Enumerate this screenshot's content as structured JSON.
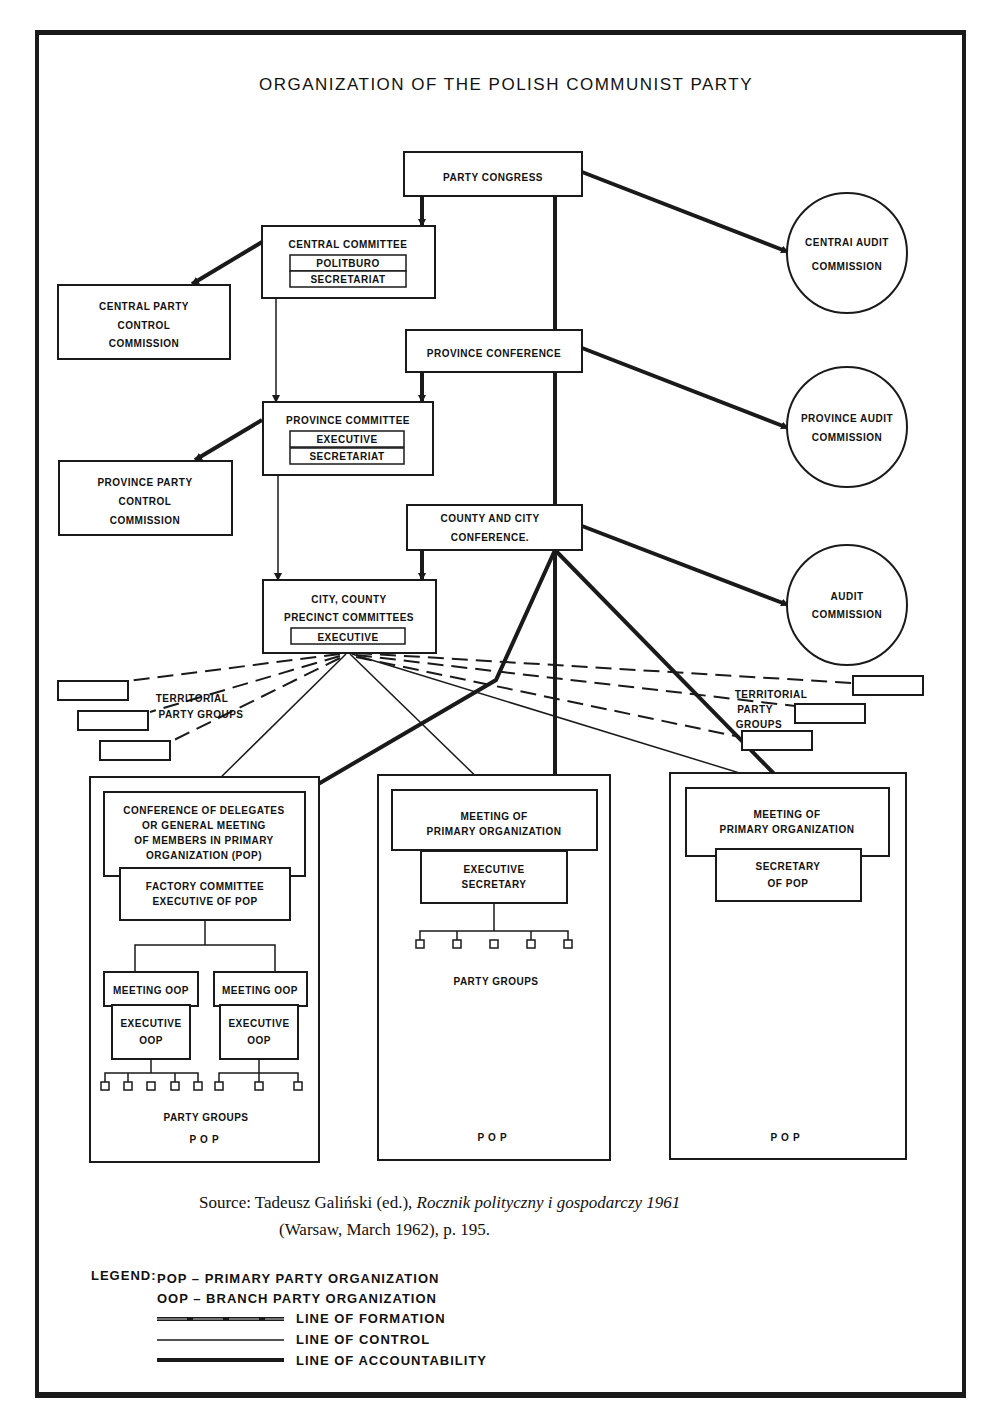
{
  "title": "ORGANIZATION OF THE POLISH COMMUNIST PARTY",
  "nodes": {
    "party_congress": "PARTY CONGRESS",
    "central_committee": {
      "title": "CENTRAL COMMITTEE",
      "sub": [
        "POLITBURO",
        "SECRETARIAT"
      ]
    },
    "central_party_control": [
      "CENTRAL PARTY",
      "CONTROL",
      "COMMISSION"
    ],
    "central_audit": [
      "CENTRAI AUDIT",
      "COMMISSION"
    ],
    "province_conference": "PROVINCE CONFERENCE",
    "province_committee": {
      "title": "PROVINCE COMMITTEE",
      "sub": [
        "EXECUTIVE",
        "SECRETARIAT"
      ]
    },
    "province_party_control": [
      "PROVINCE PARTY",
      "CONTROL",
      "COMMISSION"
    ],
    "province_audit": [
      "PROVINCE AUDIT",
      "COMMISSION"
    ],
    "county_city_conference": [
      "COUNTY AND CITY",
      "CONFERENCE."
    ],
    "city_county_committees": {
      "title": [
        "CITY, COUNTY",
        "PRECINCT COMMITTEES"
      ],
      "sub": [
        "EXECUTIVE"
      ]
    },
    "audit_commission": [
      "AUDIT",
      "COMMISSION"
    ],
    "territorial_left": [
      "TERRITORIAL",
      "PARTY GROUPS"
    ],
    "territorial_right": [
      "TERRITORIAL",
      "PARTY",
      "GROUPS"
    ]
  },
  "pop_panels": [
    {
      "meeting": [
        "CONFERENCE OF DELEGATES",
        "OR GENERAL MEETING",
        "OF MEMBERS IN PRIMARY",
        "ORGANIZATION (POP)"
      ],
      "executive": [
        "FACTORY COMMITTEE",
        "EXECUTIVE OF POP"
      ],
      "branches": [
        {
          "meeting": "MEETING OOP",
          "executive": [
            "EXECUTIVE",
            "OOP"
          ],
          "groups": 5
        },
        {
          "meeting": "MEETING OOP",
          "executive": [
            "EXECUTIVE",
            "OOP"
          ],
          "groups": 3
        }
      ],
      "groups_label": "PARTY GROUPS",
      "footer": "POP"
    },
    {
      "meeting": [
        "MEETING OF",
        "PRIMARY ORGANIZATION"
      ],
      "executive": [
        "EXECUTIVE",
        "SECRETARY"
      ],
      "groups": 5,
      "groups_label": "PARTY GROUPS",
      "footer": "POP"
    },
    {
      "meeting": [
        "MEETING OF",
        "PRIMARY ORGANIZATION"
      ],
      "executive": [
        "SECRETARY",
        "OF POP"
      ],
      "footer": "POP"
    }
  ],
  "source": {
    "prefix": "Source: Tadeusz Galiński (ed.), ",
    "book": "Rocznik polityczny i gospodarczy 1961",
    "line2": "(Warsaw, March 1962), p. 195."
  },
  "legend": {
    "label": "LEGEND:",
    "abbrevs": [
      "POP – PRIMARY PARTY ORGANIZATION",
      "OOP – BRANCH PARTY ORGANIZATION"
    ],
    "lines": [
      {
        "style": "double-thick",
        "label": "LINE OF FORMATION"
      },
      {
        "style": "thin",
        "label": "LINE OF CONTROL"
      },
      {
        "style": "thick",
        "label": "LINE OF ACCOUNTABILITY"
      }
    ]
  },
  "colors": {
    "ink": "#1a1a1a",
    "paper": "#ffffff"
  }
}
